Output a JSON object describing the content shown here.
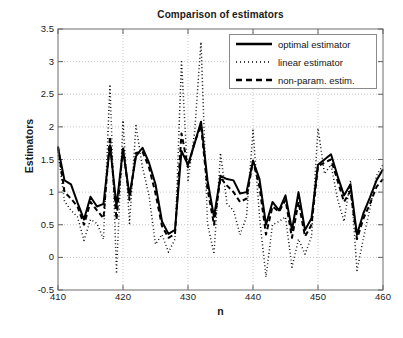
{
  "chart_data": {
    "type": "line",
    "title": "Comparison of estimators",
    "xlabel": "n",
    "ylabel": "Estimators",
    "xlim": [
      410,
      460
    ],
    "ylim": [
      -0.5,
      3.5
    ],
    "xticks": [
      410,
      420,
      430,
      440,
      450,
      460
    ],
    "yticks": [
      -0.5,
      0,
      0.5,
      1,
      1.5,
      2,
      2.5,
      3,
      3.5
    ],
    "grid": true,
    "legend_position": "top-right",
    "x": [
      410,
      411,
      412,
      413,
      414,
      415,
      416,
      417,
      418,
      419,
      420,
      421,
      422,
      423,
      424,
      425,
      426,
      427,
      428,
      429,
      430,
      431,
      432,
      433,
      434,
      435,
      436,
      437,
      438,
      439,
      440,
      441,
      442,
      443,
      444,
      445,
      446,
      447,
      448,
      449,
      450,
      451,
      452,
      453,
      454,
      455,
      456,
      457,
      458,
      459,
      460
    ],
    "series": [
      {
        "name": "optimal estimator",
        "style": "solid",
        "color": "#000000",
        "values": [
          1.68,
          1.18,
          1.12,
          0.84,
          0.58,
          0.93,
          0.78,
          0.82,
          1.72,
          0.78,
          1.66,
          0.95,
          1.55,
          1.68,
          1.45,
          1.12,
          0.55,
          0.36,
          0.42,
          1.63,
          1.42,
          1.74,
          2.08,
          1.18,
          0.62,
          1.25,
          1.2,
          1.18,
          0.98,
          1.0,
          1.48,
          1.2,
          0.5,
          0.85,
          0.72,
          0.95,
          0.42,
          1.0,
          0.42,
          0.6,
          1.42,
          1.5,
          1.58,
          1.25,
          0.95,
          1.12,
          0.35,
          0.68,
          0.92,
          1.18,
          1.35
        ]
      },
      {
        "name": "linear estimator",
        "style": "dotted",
        "color": "#000000",
        "values": [
          1.62,
          0.86,
          0.72,
          0.62,
          0.26,
          0.58,
          0.52,
          0.28,
          2.65,
          -0.25,
          2.1,
          0.52,
          2.02,
          1.38,
          0.95,
          0.2,
          0.35,
          0.08,
          0.28,
          3.0,
          1.18,
          1.9,
          3.3,
          0.52,
          0.05,
          1.6,
          0.82,
          0.72,
          0.35,
          0.62,
          1.95,
          0.62,
          -0.3,
          0.5,
          0.55,
          0.62,
          -0.15,
          0.28,
          0.05,
          0.32,
          1.98,
          1.28,
          1.42,
          0.9,
          0.55,
          1.18,
          -0.2,
          0.3,
          0.75,
          1.25,
          1.42
        ]
      },
      {
        "name": "non-param. estim.",
        "style": "dashed",
        "color": "#000000",
        "values": [
          1.7,
          1.0,
          0.9,
          0.78,
          0.5,
          0.85,
          0.72,
          0.6,
          1.85,
          0.58,
          1.7,
          0.88,
          1.6,
          1.62,
          1.38,
          0.98,
          0.48,
          0.3,
          0.36,
          1.9,
          1.38,
          1.76,
          2.02,
          1.05,
          0.5,
          1.22,
          1.1,
          1.0,
          0.85,
          0.9,
          1.48,
          1.08,
          0.35,
          0.78,
          0.7,
          0.88,
          0.3,
          0.85,
          0.32,
          0.5,
          1.4,
          1.45,
          1.5,
          1.18,
          0.85,
          1.02,
          0.28,
          0.6,
          0.82,
          1.08,
          1.2
        ]
      }
    ]
  },
  "legend": {
    "items": [
      {
        "label": "optimal estimator",
        "style": "solid"
      },
      {
        "label": "linear estimator",
        "style": "dotted"
      },
      {
        "label": "non-param. estim.",
        "style": "dashed"
      }
    ]
  },
  "axes": {
    "ytick_labels": [
      "3.5",
      "3",
      "2.5",
      "2",
      "1.5",
      "1",
      "0.5",
      "0",
      "-0.5"
    ],
    "xtick_labels": [
      "410",
      "420",
      "430",
      "440",
      "450",
      "460"
    ]
  }
}
